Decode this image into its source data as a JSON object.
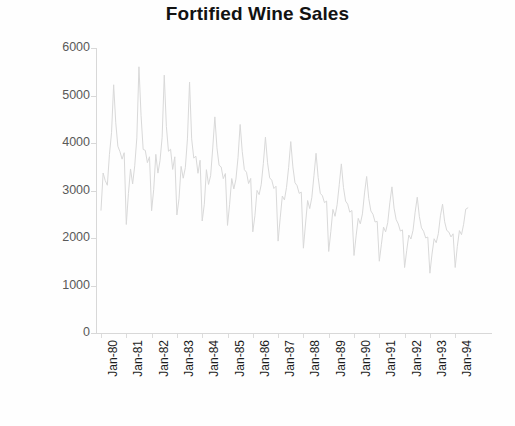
{
  "chart_data": {
    "type": "line",
    "title": "Fortified Wine Sales",
    "xlabel": "",
    "ylabel": "Thousands of litres",
    "ylim": [
      0,
      6000
    ],
    "yticks": [
      6000,
      5000,
      4000,
      3000,
      2000,
      1000,
      0
    ],
    "ytick_labels": [
      "6000",
      "5000",
      "4000",
      "3000",
      "2000",
      "1000",
      "0"
    ],
    "grid": false,
    "legend": "none",
    "line_color": "#d9d9d9",
    "x_tick_labels": [
      "Jan-80",
      "Jan-81",
      "Jan-82",
      "Jan-83",
      "Jan-84",
      "Jan-85",
      "Jan-86",
      "Jan-87",
      "Jan-88",
      "Jan-89",
      "Jan-90",
      "Jan-91",
      "Jan-92",
      "Jan-93",
      "Jan-94"
    ],
    "x_start": "Jan-80",
    "x_end": "Jul-94",
    "x_frequency": "monthly",
    "series": [
      {
        "name": "Fortified wine sales",
        "values": [
          2585,
          3368,
          3210,
          3111,
          3756,
          4216,
          5225,
          4426,
          3932,
          3816,
          3661,
          3795,
          2285,
          2934,
          3453,
          3139,
          3520,
          4109,
          5604,
          4581,
          3865,
          3846,
          3587,
          3710,
          2574,
          3024,
          3761,
          3367,
          3629,
          4119,
          5428,
          4350,
          3826,
          3868,
          3443,
          3709,
          2485,
          2827,
          3507,
          3259,
          3480,
          4087,
          5284,
          4088,
          3683,
          3722,
          3363,
          3636,
          2358,
          2709,
          3438,
          3128,
          3311,
          3896,
          4549,
          3899,
          3532,
          3495,
          3251,
          3357,
          2265,
          2709,
          3252,
          3032,
          3239,
          3698,
          4390,
          3818,
          3439,
          3384,
          3146,
          3254,
          2130,
          2468,
          3002,
          2913,
          3126,
          3568,
          4123,
          3585,
          3267,
          3216,
          3042,
          3090,
          1935,
          2423,
          2883,
          2802,
          3066,
          3488,
          4030,
          3500,
          3165,
          3101,
          2940,
          2966,
          1786,
          2295,
          2789,
          2620,
          2855,
          3312,
          3783,
          3275,
          2941,
          2890,
          2745,
          2778,
          1717,
          2132,
          2603,
          2457,
          2702,
          3122,
          3560,
          3066,
          2777,
          2713,
          2544,
          2580,
          1632,
          2045,
          2413,
          2298,
          2508,
          2949,
          3295,
          2831,
          2570,
          2499,
          2337,
          2350,
          1511,
          1868,
          2229,
          2130,
          2322,
          2743,
          3076,
          2629,
          2388,
          2296,
          2147,
          2171,
          1378,
          1737,
          2062,
          1979,
          2160,
          2542,
          2859,
          2451,
          2214,
          2142,
          2003,
          2020,
          1259,
          1661,
          1984,
          1901,
          2092,
          2468,
          2713,
          2342,
          2160,
          2124,
          2023,
          2088,
          1379,
          1820,
          2156,
          2071,
          2289,
          2607,
          2635
        ]
      }
    ]
  },
  "figure": {
    "background": "#fefefe",
    "title_color": "#121212",
    "axis_color": "#d8d8d8",
    "ytick_label_color": "#595959",
    "xtick_label_color": "#1c1c1c"
  }
}
